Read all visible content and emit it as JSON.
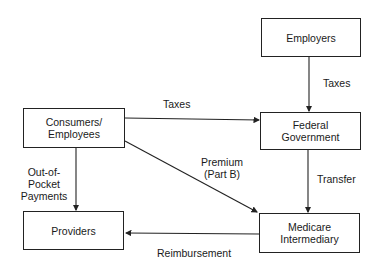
{
  "diagram": {
    "nodes": {
      "employers": "Employers",
      "consumers_l1": "Consumers/",
      "consumers_l2": "Employees",
      "federal_l1": "Federal",
      "federal_l2": "Government",
      "providers": "Providers",
      "medicare_l1": "Medicare",
      "medicare_l2": "Intermediary"
    },
    "edges": {
      "employers_to_federal": "Taxes",
      "consumers_to_federal": "Taxes",
      "consumers_to_medicare_l1": "Premium",
      "consumers_to_medicare_l2": "(Part B)",
      "consumers_to_providers_l1": "Out-of-",
      "consumers_to_providers_l2": "Pocket",
      "consumers_to_providers_l3": "Payments",
      "federal_to_medicare": "Transfer",
      "medicare_to_providers": "Reimbursement"
    }
  }
}
